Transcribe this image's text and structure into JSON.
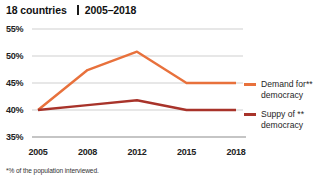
{
  "header": {
    "title": "18 countries",
    "period": "2005–2018"
  },
  "footnote": "*% of the population interviewed.",
  "colors": {
    "demand": "#E8713C",
    "supply": "#A8332A",
    "grid": "#C9C9C9",
    "axis": "#8C8C8C",
    "text": "#1a1a1a"
  },
  "legend": [
    {
      "name": "demand",
      "line1": "Demand for**",
      "line2": "democracy",
      "color": "#E8713C"
    },
    {
      "name": "supply",
      "line1": "Suppy of **",
      "line2": "democracy",
      "color": "#A8332A"
    }
  ],
  "chart_data": {
    "type": "line",
    "xlabel": "",
    "ylabel": "",
    "x": [
      "2005",
      "2008",
      "2012",
      "2015",
      "2018"
    ],
    "categories": [
      "2005",
      "2008",
      "2012",
      "2015",
      "2018"
    ],
    "yticks": [
      "35%",
      "40%",
      "45%",
      "50%",
      "55%"
    ],
    "ytick_values": [
      35,
      40,
      45,
      50,
      55
    ],
    "ylim": [
      35,
      55
    ],
    "grid": true,
    "legend_position": "right",
    "footnote": "*% of the population interviewed.",
    "series": [
      {
        "name": "Demand for** democracy",
        "color": "#E8713C",
        "values": [
          40.0,
          47.4,
          50.8,
          45.0,
          45.0
        ]
      },
      {
        "name": "Suppy of ** democracy",
        "color": "#A8332A",
        "values": [
          40.0,
          40.9,
          41.8,
          40.0,
          40.0
        ]
      }
    ]
  }
}
